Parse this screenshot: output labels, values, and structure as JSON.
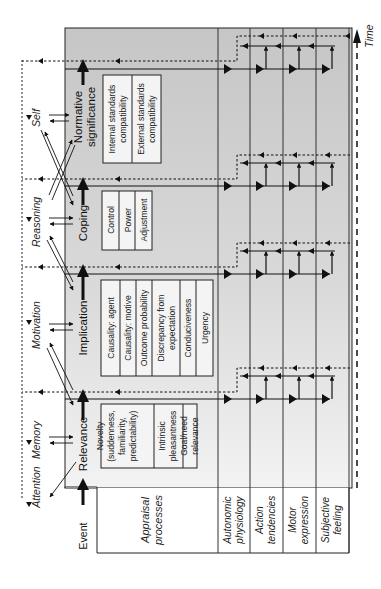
{
  "diagram": {
    "orientation": "rotated -90deg (reads bottom-to-top)",
    "time_label": "Time",
    "event_label": "Event",
    "appraisal_label_line1": "Appraisal",
    "appraisal_label_line2": "processes",
    "cognitive_functions": [
      {
        "label": "Attention"
      },
      {
        "label": "Memory"
      },
      {
        "label": "Motivation"
      },
      {
        "label": "Reasoning"
      },
      {
        "label": "Self"
      }
    ],
    "stages": [
      {
        "name": "Relevance",
        "name_line2": "",
        "checks": [
          {
            "lines": [
              "Novelty",
              "(suddenness,",
              "familiarity,",
              "predictability)"
            ]
          },
          {
            "lines": [
              "Intrinsic",
              "pleasantness"
            ]
          },
          {
            "lines": [
              "Goal/need",
              "relevance"
            ]
          }
        ]
      },
      {
        "name": "Implication",
        "name_line2": "",
        "checks": [
          {
            "lines": [
              "Causality: agent"
            ]
          },
          {
            "lines": [
              "Causality: motive"
            ]
          },
          {
            "lines": [
              "Outcome probability"
            ]
          },
          {
            "lines": [
              "Discrepancy from",
              "expectation"
            ]
          },
          {
            "lines": [
              "Conduciveness"
            ]
          },
          {
            "lines": [
              "Urgency"
            ]
          }
        ]
      },
      {
        "name": "Coping",
        "name_line2": "",
        "checks": [
          {
            "lines": [
              "Control"
            ]
          },
          {
            "lines": [
              "Power"
            ]
          },
          {
            "lines": [
              "Adjustment"
            ]
          }
        ]
      },
      {
        "name": "Normative",
        "name_line2": "significance",
        "checks": [
          {
            "lines": [
              "Internal standards",
              "compatibility"
            ]
          },
          {
            "lines": [
              "External standards",
              "compatibility"
            ]
          }
        ]
      }
    ],
    "response_components": [
      {
        "line1": "Autonomic",
        "line2": "physiology"
      },
      {
        "line1": "Action",
        "line2": "tendencies"
      },
      {
        "line1": "Motor",
        "line2": "expression"
      },
      {
        "line1": "Subjective",
        "line2": "feeling"
      }
    ],
    "colors": {
      "panel_gray_top": "#c9c9c9",
      "panel_gray_bottom": "#f1f1f1",
      "line": "#1a1a1a",
      "background": "#ffffff"
    }
  }
}
